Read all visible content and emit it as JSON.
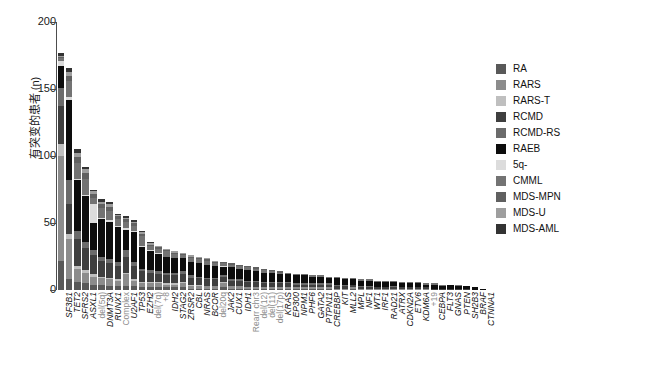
{
  "chart_data": {
    "type": "bar",
    "subtype": "stacked-bar",
    "title": "",
    "xlabel": "",
    "ylabel": "有突变的患者 (n)",
    "ylim": [
      0,
      200
    ],
    "yticks": [
      0,
      50,
      100,
      150,
      200
    ],
    "grid": false,
    "legend_position": "right",
    "series": [
      {
        "name": "RA",
        "color": "#595959"
      },
      {
        "name": "RARS",
        "color": "#8c8c8c"
      },
      {
        "name": "RARS-T",
        "color": "#bfbfbf"
      },
      {
        "name": "RCMD",
        "color": "#3f3f3f"
      },
      {
        "name": "RCMD-RS",
        "color": "#6b6b6b"
      },
      {
        "name": "RAEB",
        "color": "#0d0d0d"
      },
      {
        "name": "5q-",
        "color": "#dcdcdc"
      },
      {
        "name": "CMML",
        "color": "#737373"
      },
      {
        "name": "MDS-MPN",
        "color": "#606060"
      },
      {
        "name": "MDS-U",
        "color": "#9e9e9e"
      },
      {
        "name": "MDS-AML",
        "color": "#333333"
      }
    ],
    "categories": [
      "SF3B1",
      "TET2",
      "SFRS2",
      "ASXL1",
      "del(5q)",
      "DNMT3A",
      "RUNX1",
      "Complex",
      "U2AF1",
      "TP53",
      "EZH2",
      "del(7q)",
      "+8",
      "IDH2",
      "STAG2",
      "ZRSR2",
      "CBL",
      "NRAS",
      "BCOR",
      "del20q",
      "JAK2",
      "CUX1",
      "IDH1",
      "Rearr chr3",
      "del(12)",
      "del(11)",
      "del(17p)",
      "KRAS",
      "EP300",
      "NPM1",
      "PHF6",
      "GATA2",
      "PTPN11",
      "CREBBP",
      "KIT",
      "MLL2",
      "MPL",
      "NF1",
      "WT1",
      "IRF1",
      "RAD21",
      "ATRX",
      "CDKN2A",
      "ETV6",
      "KDM6A",
      "+19",
      "CEBPA",
      "FLT3",
      "GNAS",
      "PTEN",
      "SH2B3",
      "BRAF",
      "CTNNA1"
    ],
    "category_styles": [
      "gene",
      "gene",
      "gene",
      "gene",
      "cyto",
      "gene",
      "gene",
      "cyto",
      "gene",
      "gene",
      "gene",
      "cyto",
      "cyto",
      "gene",
      "gene",
      "gene",
      "gene",
      "gene",
      "gene",
      "cyto",
      "gene",
      "gene",
      "gene",
      "cyto",
      "cyto",
      "cyto",
      "cyto",
      "gene",
      "gene",
      "gene",
      "gene",
      "gene",
      "gene",
      "gene",
      "gene",
      "gene",
      "gene",
      "gene",
      "gene",
      "gene",
      "gene",
      "gene",
      "gene",
      "gene",
      "gene",
      "cyto",
      "gene",
      "gene",
      "gene",
      "gene",
      "gene",
      "gene",
      "gene"
    ],
    "totals": [
      177,
      166,
      105,
      92,
      75,
      68,
      66,
      57,
      55,
      52,
      44,
      36,
      33,
      31,
      29,
      28,
      26,
      25,
      24,
      22,
      21,
      20,
      19,
      18,
      17,
      16,
      15,
      14,
      13,
      12,
      12,
      11,
      11,
      10,
      10,
      9,
      9,
      8,
      8,
      7,
      7,
      7,
      6,
      6,
      6,
      5,
      5,
      4,
      4,
      4,
      3,
      2,
      1
    ],
    "stacks": [
      [
        22,
        78,
        9,
        28,
        14,
        16,
        4,
        2,
        1,
        1,
        2
      ],
      [
        8,
        30,
        4,
        22,
        18,
        60,
        2,
        12,
        4,
        3,
        3
      ],
      [
        6,
        10,
        2,
        20,
        6,
        38,
        1,
        12,
        4,
        3,
        3
      ],
      [
        5,
        8,
        2,
        16,
        5,
        34,
        1,
        12,
        4,
        3,
        2
      ],
      [
        4,
        6,
        2,
        14,
        4,
        20,
        14,
        5,
        3,
        2,
        1
      ],
      [
        4,
        5,
        1,
        12,
        3,
        28,
        1,
        7,
        3,
        2,
        2
      ],
      [
        3,
        5,
        1,
        11,
        3,
        28,
        1,
        7,
        3,
        2,
        2
      ],
      [
        3,
        4,
        1,
        10,
        3,
        26,
        1,
        5,
        2,
        1,
        1
      ],
      [
        3,
        9,
        1,
        12,
        5,
        15,
        1,
        5,
        2,
        1,
        1
      ],
      [
        3,
        4,
        1,
        10,
        3,
        22,
        1,
        4,
        2,
        1,
        1
      ],
      [
        2,
        3,
        1,
        8,
        2,
        16,
        1,
        7,
        2,
        1,
        1
      ],
      [
        2,
        3,
        1,
        7,
        2,
        14,
        1,
        3,
        1,
        1,
        1
      ],
      [
        2,
        3,
        1,
        6,
        2,
        13,
        1,
        3,
        1,
        1,
        0
      ],
      [
        2,
        2,
        1,
        6,
        2,
        12,
        0,
        4,
        1,
        1,
        0
      ],
      [
        2,
        2,
        1,
        6,
        2,
        11,
        0,
        3,
        1,
        1,
        0
      ],
      [
        2,
        3,
        1,
        6,
        2,
        10,
        0,
        2,
        1,
        1,
        0
      ],
      [
        1,
        2,
        1,
        5,
        2,
        10,
        0,
        3,
        1,
        1,
        0
      ],
      [
        1,
        2,
        1,
        5,
        1,
        10,
        0,
        3,
        1,
        1,
        0
      ],
      [
        1,
        2,
        0,
        5,
        1,
        10,
        0,
        3,
        1,
        1,
        0
      ],
      [
        1,
        2,
        0,
        5,
        1,
        9,
        0,
        2,
        1,
        1,
        0
      ],
      [
        2,
        3,
        1,
        4,
        1,
        6,
        1,
        2,
        1,
        0,
        0
      ],
      [
        1,
        2,
        0,
        4,
        1,
        9,
        0,
        2,
        1,
        0,
        0
      ],
      [
        1,
        2,
        0,
        4,
        1,
        8,
        0,
        2,
        1,
        0,
        0
      ],
      [
        1,
        1,
        0,
        4,
        1,
        8,
        0,
        2,
        1,
        0,
        0
      ],
      [
        1,
        1,
        0,
        4,
        1,
        7,
        0,
        2,
        1,
        0,
        0
      ],
      [
        1,
        1,
        0,
        3,
        1,
        7,
        0,
        2,
        1,
        0,
        0
      ],
      [
        1,
        1,
        0,
        3,
        1,
        7,
        0,
        1,
        1,
        0,
        0
      ],
      [
        1,
        1,
        0,
        3,
        1,
        6,
        0,
        1,
        1,
        0,
        0
      ],
      [
        1,
        1,
        0,
        3,
        1,
        6,
        0,
        1,
        0,
        0,
        0
      ],
      [
        1,
        1,
        0,
        2,
        1,
        6,
        0,
        1,
        0,
        0,
        0
      ],
      [
        1,
        1,
        0,
        2,
        1,
        6,
        0,
        1,
        0,
        0,
        0
      ],
      [
        1,
        1,
        0,
        2,
        1,
        5,
        0,
        1,
        0,
        0,
        0
      ],
      [
        1,
        1,
        0,
        2,
        1,
        5,
        0,
        1,
        0,
        0,
        0
      ],
      [
        1,
        1,
        0,
        2,
        1,
        4,
        0,
        1,
        0,
        0,
        0
      ],
      [
        0,
        1,
        0,
        2,
        1,
        5,
        0,
        1,
        0,
        0,
        0
      ],
      [
        0,
        1,
        0,
        2,
        1,
        4,
        0,
        1,
        0,
        0,
        0
      ],
      [
        1,
        1,
        0,
        2,
        0,
        4,
        0,
        1,
        0,
        0,
        0
      ],
      [
        0,
        1,
        0,
        1,
        1,
        4,
        0,
        1,
        0,
        0,
        0
      ],
      [
        0,
        1,
        0,
        1,
        1,
        4,
        0,
        1,
        0,
        0,
        0
      ],
      [
        0,
        1,
        0,
        1,
        0,
        4,
        0,
        1,
        0,
        0,
        0
      ],
      [
        0,
        1,
        0,
        1,
        0,
        4,
        0,
        1,
        0,
        0,
        0
      ],
      [
        0,
        1,
        0,
        1,
        1,
        3,
        0,
        1,
        0,
        0,
        0
      ],
      [
        0,
        1,
        0,
        1,
        0,
        3,
        0,
        1,
        0,
        0,
        0
      ],
      [
        0,
        1,
        0,
        1,
        0,
        3,
        0,
        1,
        0,
        0,
        0
      ],
      [
        0,
        1,
        0,
        1,
        0,
        3,
        0,
        1,
        0,
        0,
        0
      ],
      [
        0,
        1,
        0,
        1,
        0,
        2,
        0,
        1,
        0,
        0,
        0
      ],
      [
        0,
        0,
        0,
        1,
        0,
        3,
        0,
        1,
        0,
        0,
        0
      ],
      [
        0,
        0,
        0,
        1,
        0,
        2,
        0,
        1,
        0,
        0,
        0
      ],
      [
        0,
        0,
        0,
        1,
        0,
        3,
        0,
        0,
        0,
        0,
        0
      ],
      [
        0,
        0,
        0,
        1,
        0,
        2,
        0,
        1,
        0,
        0,
        0
      ],
      [
        0,
        0,
        0,
        1,
        0,
        2,
        0,
        0,
        0,
        0,
        0
      ],
      [
        0,
        0,
        0,
        0,
        0,
        2,
        0,
        0,
        0,
        0,
        0
      ],
      [
        0,
        0,
        0,
        0,
        0,
        1,
        0,
        0,
        0,
        0,
        0
      ]
    ]
  }
}
